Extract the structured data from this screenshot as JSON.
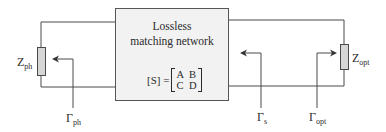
{
  "diagram": {
    "box": {
      "title_line1": "Lossless",
      "title_line2": "matching network",
      "matrix_lhs": "[S] =",
      "matrix": [
        "A",
        "B",
        "C",
        "D"
      ]
    },
    "left_load": {
      "label_main": "Z",
      "label_sub": "ph"
    },
    "right_load": {
      "label_main": "Z",
      "label_sub": "opt"
    },
    "reflections": [
      {
        "label_main": "Γ",
        "label_sub": "ph",
        "direction": "left"
      },
      {
        "label_main": "Γ",
        "label_sub": "s",
        "direction": "left"
      },
      {
        "label_main": "Γ",
        "label_sub": "opt",
        "direction": "right"
      }
    ],
    "colors": {
      "line": "#4a4a4a",
      "box_fill": "#f2f2f2",
      "resistor_fill": "#d6d6d6"
    }
  }
}
